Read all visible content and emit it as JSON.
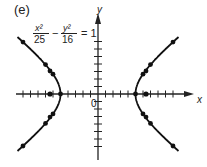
{
  "panel_label": "(e)",
  "equation": {
    "x_num": "x²",
    "x_den": "25",
    "minus": "−",
    "y_num": "y²",
    "y_den": "16",
    "rhs": "= 1"
  },
  "axes": {
    "x_label": "x",
    "y_label": "y",
    "origin_label": "0"
  },
  "chart_data": {
    "type": "line",
    "xlabel": "x",
    "ylabel": "y",
    "xlim": [
      -11,
      11
    ],
    "ylim": [
      -8,
      8
    ],
    "grid": false,
    "ticks": {
      "x": [
        -10,
        -9,
        -8,
        -7,
        -6,
        -5,
        -4,
        -3,
        -2,
        -1,
        1,
        2,
        3,
        4,
        5,
        6,
        7,
        8,
        9,
        10
      ],
      "y": [
        -7,
        -6,
        -5,
        -4,
        -3,
        -2,
        -1,
        1,
        2,
        3,
        4,
        5,
        6,
        7
      ]
    },
    "series": [
      {
        "name": "right branch",
        "a": 5,
        "b": 4,
        "side": 1
      },
      {
        "name": "left branch",
        "a": 5,
        "b": 4,
        "side": -1
      }
    ],
    "marked_points": [
      [
        5,
        0
      ],
      [
        6,
        2.65
      ],
      [
        6.4,
        3.07
      ],
      [
        7,
        3.92
      ],
      [
        10,
        6.93
      ],
      [
        6,
        -2.65
      ],
      [
        6.4,
        -3.07
      ],
      [
        7,
        -3.92
      ],
      [
        10,
        -6.93
      ],
      [
        -5,
        0
      ],
      [
        -6,
        2.65
      ],
      [
        -6.4,
        3.07
      ],
      [
        -7,
        3.92
      ],
      [
        -10,
        6.93
      ],
      [
        -6,
        -2.65
      ],
      [
        -6.4,
        -3.07
      ],
      [
        -7,
        -3.92
      ],
      [
        -10,
        -6.93
      ]
    ],
    "foci": [
      [
        6.4,
        0
      ],
      [
        -6.4,
        0
      ]
    ]
  }
}
